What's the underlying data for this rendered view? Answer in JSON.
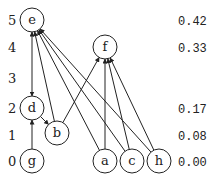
{
  "levels": [
    {
      "label": "5",
      "y": 20,
      "value": "0.42"
    },
    {
      "label": "4",
      "y": 47,
      "value": "0.33"
    },
    {
      "label": "3",
      "y": 78,
      "value": ""
    },
    {
      "label": "2",
      "y": 108,
      "value": "0.17"
    },
    {
      "label": "1",
      "y": 135,
      "value": "0.08"
    },
    {
      "label": "0",
      "y": 161,
      "value": "0.00"
    }
  ],
  "nodes": [
    {
      "id": "e",
      "label": "e",
      "x": 32,
      "y": 20
    },
    {
      "id": "f",
      "label": "f",
      "x": 105,
      "y": 47
    },
    {
      "id": "d",
      "label": "d",
      "x": 32,
      "y": 108
    },
    {
      "id": "b",
      "label": "b",
      "x": 57,
      "y": 133
    },
    {
      "id": "g",
      "label": "g",
      "x": 32,
      "y": 161
    },
    {
      "id": "a",
      "label": "a",
      "x": 105,
      "y": 161
    },
    {
      "id": "c",
      "label": "c",
      "x": 132,
      "y": 161
    },
    {
      "id": "h",
      "label": "h",
      "x": 159,
      "y": 161
    }
  ],
  "edges": [
    {
      "from": "d",
      "to": "e",
      "bidirectional": true
    },
    {
      "from": "g",
      "to": "d"
    },
    {
      "from": "d",
      "to": "b"
    },
    {
      "from": "b",
      "to": "e"
    },
    {
      "from": "a",
      "to": "e"
    },
    {
      "from": "c",
      "to": "e"
    },
    {
      "from": "h",
      "to": "e"
    },
    {
      "from": "b",
      "to": "f"
    },
    {
      "from": "a",
      "to": "f"
    },
    {
      "from": "c",
      "to": "f"
    },
    {
      "from": "h",
      "to": "f"
    }
  ],
  "colors": {
    "stroke": "#222222",
    "background": "#ffffff"
  }
}
